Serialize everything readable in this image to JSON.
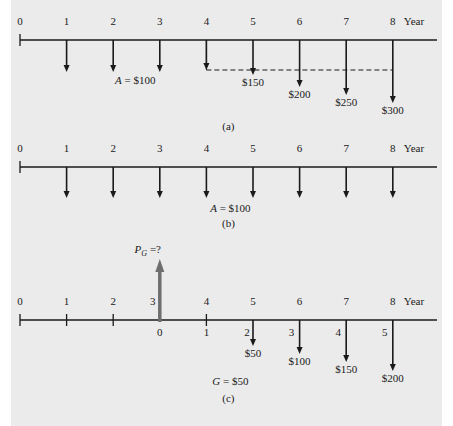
{
  "axis_label": "Year",
  "years": [
    "0",
    "1",
    "2",
    "3",
    "4",
    "5",
    "6",
    "7",
    "8"
  ],
  "panels": [
    {
      "id": "a",
      "caption": "(a)",
      "axis_y": 40,
      "uniform_label": "A = $100",
      "arrows": [
        {
          "year": 1,
          "tip": 72,
          "label": ""
        },
        {
          "year": 2,
          "tip": 72,
          "label": ""
        },
        {
          "year": 3,
          "tip": 72,
          "label": ""
        },
        {
          "year": 4,
          "tip": 70,
          "label": ""
        },
        {
          "year": 5,
          "tip": 75,
          "label": "$150"
        },
        {
          "year": 6,
          "tip": 87,
          "label": "$200"
        },
        {
          "year": 7,
          "tip": 95,
          "label": "$250"
        },
        {
          "year": 8,
          "tip": 103,
          "label": "$300"
        }
      ],
      "dashed_y": 70
    },
    {
      "id": "b",
      "caption": "(b)",
      "axis_y": 167,
      "uniform_label": "A = $100",
      "arrows": [
        {
          "year": 1,
          "tip": 198
        },
        {
          "year": 2,
          "tip": 198
        },
        {
          "year": 3,
          "tip": 198
        },
        {
          "year": 4,
          "tip": 198
        },
        {
          "year": 5,
          "tip": 198
        },
        {
          "year": 6,
          "tip": 198
        },
        {
          "year": 7,
          "tip": 198
        },
        {
          "year": 8,
          "tip": 198
        }
      ]
    },
    {
      "id": "c",
      "caption": "(c)",
      "axis_y": 320,
      "present_worth_label": "P",
      "present_worth_sub": "G",
      "present_worth_suffix": " =?",
      "gradient_label": "G = $50",
      "shifted_years": [
        "0",
        "1",
        "2",
        "3",
        "4",
        "5"
      ],
      "arrows": [
        {
          "year": 5,
          "tip": 346,
          "label": "$50"
        },
        {
          "year": 6,
          "tip": 354,
          "label": "$100"
        },
        {
          "year": 7,
          "tip": 362,
          "label": "$150"
        },
        {
          "year": 8,
          "tip": 371,
          "label": "$200"
        }
      ]
    }
  ],
  "colors": {
    "background": "#ebebeb",
    "line": "#1a1a1a",
    "pg_arrow": "#6e6e6e"
  }
}
